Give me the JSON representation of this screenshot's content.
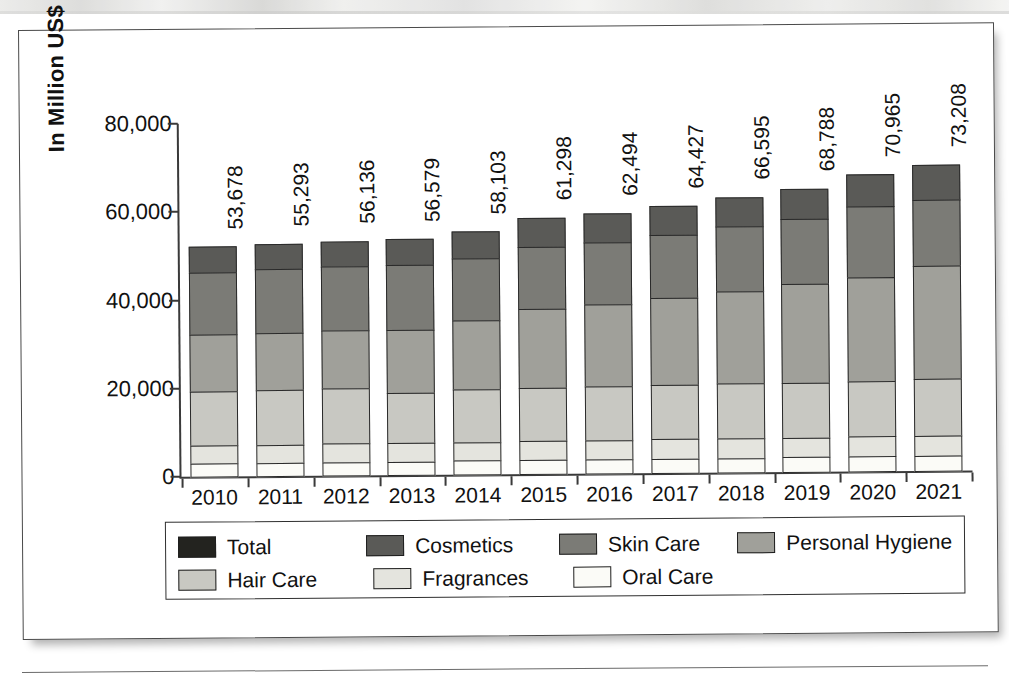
{
  "chart_data": {
    "type": "bar",
    "subtype": "stacked-bar",
    "title": "",
    "xlabel": "",
    "ylabel": "In Million US$",
    "ylim": [
      0,
      80000
    ],
    "ytick_labels": [
      "0",
      "20,000",
      "40,000",
      "60,000",
      "80,000"
    ],
    "ytick_values": [
      0,
      20000,
      40000,
      60000,
      80000
    ],
    "grid": false,
    "legend_position": "bottom",
    "categories": [
      "2010",
      "2011",
      "2012",
      "2013",
      "2014",
      "2015",
      "2016",
      "2017",
      "2018",
      "2019",
      "2020",
      "2021"
    ],
    "bar_labels": [
      "53,678",
      "55,293",
      "56,136",
      "56,579",
      "58,103",
      "61,298",
      "62,494",
      "64,427",
      "66,595",
      "68,788",
      "70,965",
      "73,208"
    ],
    "series": [
      {
        "name": "Oral Care",
        "color": "#fbfbf7",
        "values": [
          3200,
          3200,
          3250,
          3250,
          3300,
          3350,
          3400,
          3450,
          3500,
          3550,
          3600,
          3650
        ]
      },
      {
        "name": "Fragrances",
        "color": "#e4e4de",
        "values": [
          4300,
          4300,
          4350,
          4400,
          4450,
          4500,
          4550,
          4600,
          4650,
          4700,
          4750,
          4800
        ]
      },
      {
        "name": "Hair Care",
        "color": "#c8c8c2",
        "values": [
          12500,
          12600,
          12700,
          11550,
          12100,
          12400,
          12350,
          12550,
          12600,
          12700,
          12800,
          13000
        ]
      },
      {
        "name": "Personal Hygiene",
        "color": "#a0a09a",
        "values": [
          13100,
          13200,
          13450,
          14550,
          15900,
          18100,
          18900,
          19950,
          21200,
          22550,
          23700,
          26000
        ]
      },
      {
        "name": "Skin Care",
        "color": "#7b7b76",
        "values": [
          14200,
          14700,
          14650,
          14950,
          14250,
          14350,
          14400,
          14550,
          14900,
          15000,
          16400,
          15100
        ]
      },
      {
        "name": "Cosmetics",
        "color": "#5a5a57",
        "values": [
          6100,
          6000,
          6100,
          6050,
          6350,
          6750,
          6750,
          6800,
          6950,
          7100,
          7400,
          8200
        ]
      }
    ],
    "total_series": {
      "name": "Total",
      "color": "#23231f",
      "values": [
        53678,
        55293,
        56136,
        56579,
        58103,
        61298,
        62494,
        64427,
        66595,
        68788,
        70965,
        73208
      ]
    }
  },
  "legend": {
    "rows": [
      [
        {
          "label": "Total",
          "color": "#23231f"
        },
        {
          "label": "Cosmetics",
          "color": "#5a5a57"
        },
        {
          "label": "Skin Care",
          "color": "#7b7b76"
        },
        {
          "label": "Personal Hygiene",
          "color": "#a0a09a"
        }
      ],
      [
        {
          "label": "Hair Care",
          "color": "#c8c8c2"
        },
        {
          "label": "Fragrances",
          "color": "#e4e4de"
        },
        {
          "label": "Oral Care",
          "color": "#fbfbf7"
        }
      ]
    ]
  }
}
